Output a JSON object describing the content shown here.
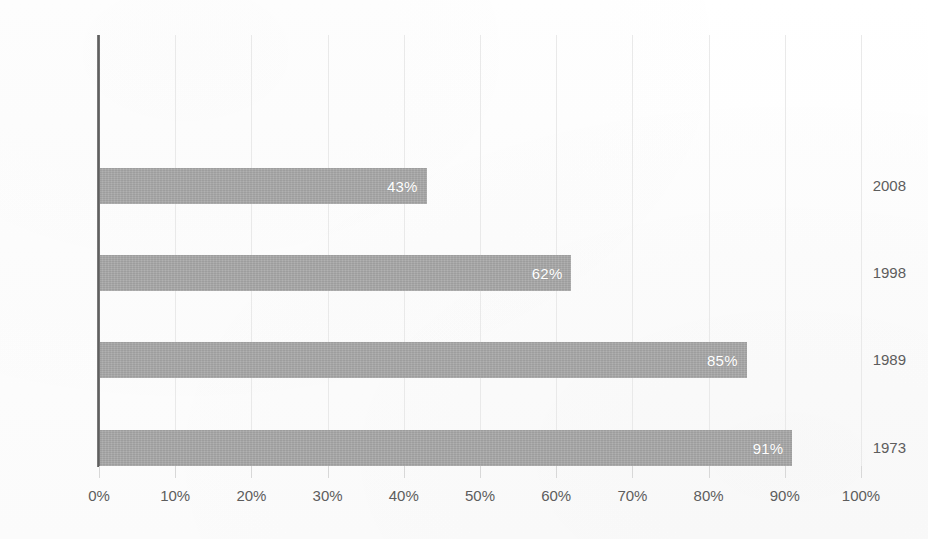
{
  "chart_data": {
    "type": "bar",
    "orientation": "horizontal",
    "title": "",
    "subtitle": "",
    "xlabel": "",
    "ylabel": "",
    "categories": [
      "2008",
      "1998",
      "1989",
      "1973"
    ],
    "values": [
      43,
      62,
      85,
      91
    ],
    "value_labels": [
      "43%",
      "62%",
      "85%",
      "91%"
    ],
    "xlim": [
      0,
      100
    ],
    "xticks": [
      0,
      10,
      20,
      30,
      40,
      50,
      60,
      70,
      80,
      90,
      100
    ],
    "xtick_labels": [
      "0%",
      "10%",
      "20%",
      "30%",
      "40%",
      "50%",
      "60%",
      "70%",
      "80%",
      "90%",
      "100%"
    ],
    "grid": true,
    "grid_axis": "x",
    "legend": false,
    "legend_position": "none",
    "series": [
      {
        "name": "",
        "values": [
          43,
          62,
          85,
          91
        ]
      }
    ],
    "colors": {
      "bar_fill": "#a8a8a8",
      "value_label": "#ffffff",
      "axis_line": "#6f6f6f",
      "gridline": "#e9e9e9",
      "tick_label": "#5d5d5d",
      "category_label": "#5d5d5d",
      "background": "#fdfdfd"
    }
  }
}
